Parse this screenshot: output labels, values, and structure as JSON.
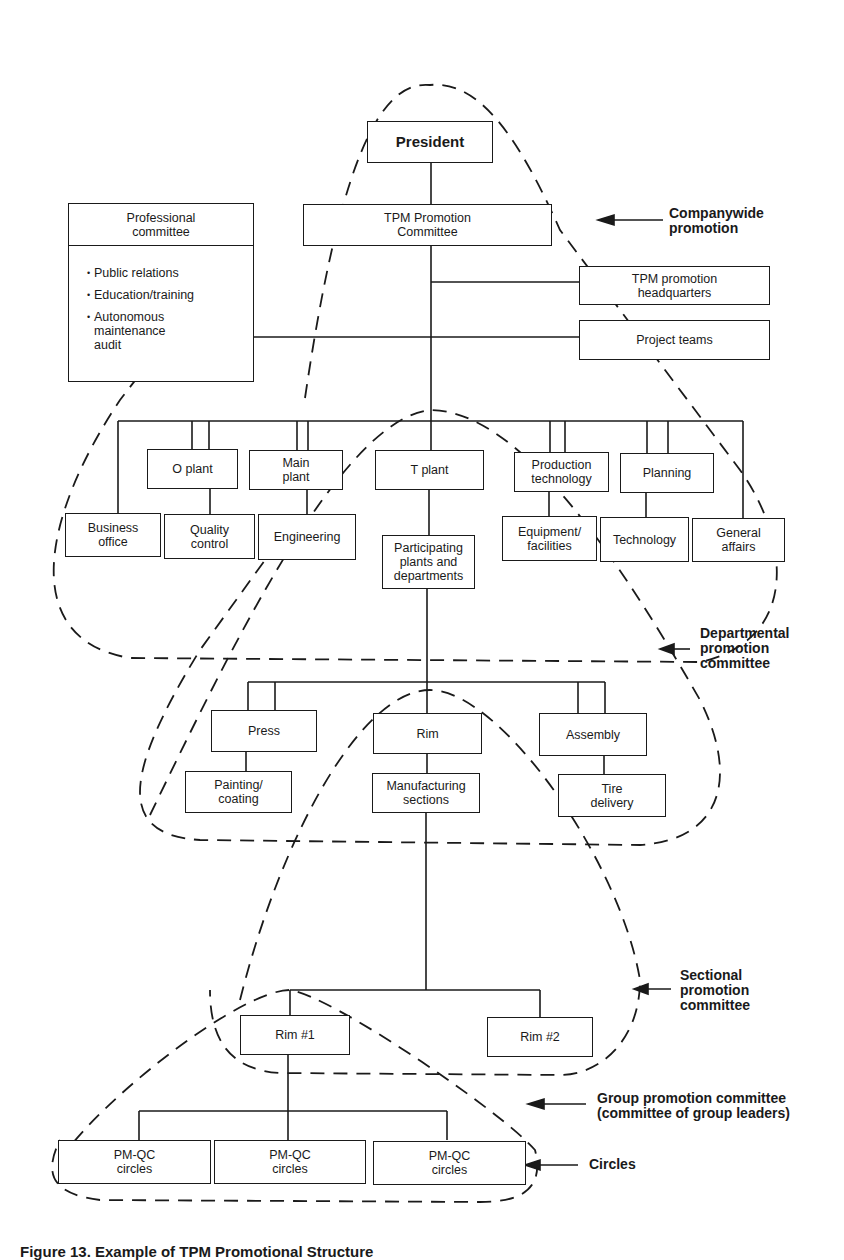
{
  "diagram": {
    "caption": "Figure 13. Example of TPM Promotional Structure",
    "top": {
      "president": "President",
      "tpm_promotion_committee": "TPM Promotion\nCommittee",
      "professional_committee": {
        "title": "Professional\ncommittee",
        "items": [
          "Public relations",
          "Education/training",
          "Autonomous\nmaintenance\naudit"
        ]
      },
      "tpm_promotion_headquarters": "TPM promotion\nheadquarters",
      "project_teams": "Project teams"
    },
    "departments": {
      "upper_row": [
        "O plant",
        "Main\nplant",
        "T plant",
        "Production\ntechnology",
        "Planning"
      ],
      "lower_row": [
        "Business\noffice",
        "Quality\ncontrol",
        "Engineering",
        "Equipment/\nfacilities",
        "Technology",
        "General\naffairs"
      ],
      "participating": "Participating\nplants and\ndepartments"
    },
    "plant": {
      "upper_row": [
        "Press",
        "Rim",
        "Assembly"
      ],
      "lower_row": [
        "Painting/\ncoating",
        "Manufacturing\nsections",
        "Tire\ndelivery"
      ]
    },
    "sections": [
      "Rim #1",
      "Rim #2"
    ],
    "circles": [
      "PM-QC\ncircles",
      "PM-QC\ncircles",
      "PM-QC\ncircles"
    ],
    "level_labels": {
      "companywide": "Companywide\npromotion",
      "departmental": "Departmental\npromotion\ncommittee",
      "sectional": "Sectional\npromotion\ncommittee",
      "group": "Group promotion committee\n(committee of group leaders)",
      "circles": "Circles"
    }
  }
}
